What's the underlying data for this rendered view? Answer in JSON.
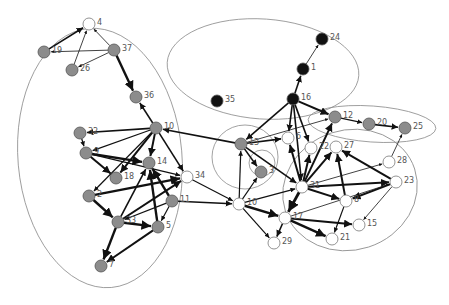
{
  "diagram": {
    "type": "directed-network-graph",
    "node_colors": {
      "gray": "#8c8c8c",
      "black": "#111111",
      "white": "#ffffff"
    },
    "edge_color": "#111111",
    "cluster_color": "#8a8a8a",
    "clusters": [
      {
        "id": "left",
        "cx": 100,
        "cy": 158,
        "rx": 82,
        "ry": 130,
        "rot": -5
      },
      {
        "id": "top-center",
        "cx": 263,
        "cy": 69,
        "rx": 96,
        "ry": 50,
        "rot": 4
      },
      {
        "id": "right-top",
        "cx": 372,
        "cy": 124,
        "rx": 64,
        "ry": 18,
        "rot": 4
      },
      {
        "id": "center-small",
        "cx": 245,
        "cy": 157,
        "rx": 33,
        "ry": 32,
        "rot": 0
      },
      {
        "id": "center-tiny",
        "cx": 262,
        "cy": 163,
        "rx": 13,
        "ry": 13,
        "rot": 0
      },
      {
        "id": "right-bottom",
        "cx": 350,
        "cy": 190,
        "rx": 68,
        "ry": 60,
        "rot": -18
      }
    ],
    "nodes": [
      {
        "id": "4",
        "label": "4",
        "x": 89,
        "y": 24,
        "color": "white"
      },
      {
        "id": "19",
        "label": "19",
        "x": 44,
        "y": 52,
        "color": "gray"
      },
      {
        "id": "37",
        "label": "37",
        "x": 114,
        "y": 50,
        "color": "gray"
      },
      {
        "id": "26",
        "label": "26",
        "x": 72,
        "y": 70,
        "color": "gray"
      },
      {
        "id": "36",
        "label": "36",
        "x": 136,
        "y": 97,
        "color": "gray"
      },
      {
        "id": "10a",
        "label": "10",
        "x": 156,
        "y": 128,
        "color": "gray"
      },
      {
        "id": "32",
        "label": "32",
        "x": 80,
        "y": 133,
        "color": "gray"
      },
      {
        "id": "9",
        "label": "9",
        "x": 86,
        "y": 153,
        "color": "gray"
      },
      {
        "id": "14",
        "label": "14",
        "x": 149,
        "y": 163,
        "color": "gray"
      },
      {
        "id": "18",
        "label": "18",
        "x": 116,
        "y": 178,
        "color": "gray"
      },
      {
        "id": "34",
        "label": "34",
        "x": 187,
        "y": 177,
        "color": "white"
      },
      {
        "id": "2",
        "label": "2",
        "x": 89,
        "y": 196,
        "color": "gray"
      },
      {
        "id": "11",
        "label": "11",
        "x": 172,
        "y": 201,
        "color": "gray"
      },
      {
        "id": "33",
        "label": "33",
        "x": 118,
        "y": 222,
        "color": "gray"
      },
      {
        "id": "5",
        "label": "5",
        "x": 158,
        "y": 227,
        "color": "gray"
      },
      {
        "id": "7",
        "label": "7",
        "x": 101,
        "y": 266,
        "color": "gray"
      },
      {
        "id": "24",
        "label": "24",
        "x": 322,
        "y": 39,
        "color": "black"
      },
      {
        "id": "1",
        "label": "1",
        "x": 303,
        "y": 69,
        "color": "black"
      },
      {
        "id": "35",
        "label": "35",
        "x": 217,
        "y": 101,
        "color": "black"
      },
      {
        "id": "16",
        "label": "16",
        "x": 293,
        "y": 99,
        "color": "black"
      },
      {
        "id": "12",
        "label": "12",
        "x": 335,
        "y": 117,
        "color": "gray"
      },
      {
        "id": "20",
        "label": "20",
        "x": 369,
        "y": 124,
        "color": "gray"
      },
      {
        "id": "25",
        "label": "25",
        "x": 405,
        "y": 128,
        "color": "gray"
      },
      {
        "id": "13",
        "label": "13",
        "x": 241,
        "y": 144,
        "color": "gray"
      },
      {
        "id": "6",
        "label": "6",
        "x": 288,
        "y": 138,
        "color": "white"
      },
      {
        "id": "22",
        "label": "22",
        "x": 311,
        "y": 148,
        "color": "white"
      },
      {
        "id": "27",
        "label": "27",
        "x": 336,
        "y": 147,
        "color": "white"
      },
      {
        "id": "28",
        "label": "28",
        "x": 389,
        "y": 162,
        "color": "white"
      },
      {
        "id": "3",
        "label": "3",
        "x": 261,
        "y": 172,
        "color": "gray"
      },
      {
        "id": "31",
        "label": "31",
        "x": 302,
        "y": 187,
        "color": "white"
      },
      {
        "id": "23",
        "label": "23",
        "x": 396,
        "y": 182,
        "color": "white"
      },
      {
        "id": "8",
        "label": "8",
        "x": 346,
        "y": 201,
        "color": "white"
      },
      {
        "id": "10b",
        "label": "10",
        "x": 239,
        "y": 204,
        "color": "white"
      },
      {
        "id": "17",
        "label": "17",
        "x": 285,
        "y": 218,
        "color": "white"
      },
      {
        "id": "15",
        "label": "15",
        "x": 359,
        "y": 225,
        "color": "white"
      },
      {
        "id": "21",
        "label": "21",
        "x": 332,
        "y": 239,
        "color": "white"
      },
      {
        "id": "29",
        "label": "29",
        "x": 274,
        "y": 243,
        "color": "white"
      }
    ],
    "edges": [
      {
        "from": "19",
        "to": "4",
        "w": 1.6
      },
      {
        "from": "37",
        "to": "4",
        "w": 0.8
      },
      {
        "from": "26",
        "to": "4",
        "w": 0.8
      },
      {
        "from": "37",
        "to": "19",
        "w": 0.8
      },
      {
        "from": "37",
        "to": "26",
        "w": 0.8
      },
      {
        "from": "37",
        "to": "36",
        "w": 2.4
      },
      {
        "from": "10a",
        "to": "36",
        "w": 1.6
      },
      {
        "from": "10a",
        "to": "32",
        "w": 1.6
      },
      {
        "from": "10a",
        "to": "9",
        "w": 1.2
      },
      {
        "from": "10a",
        "to": "14",
        "w": 2.0
      },
      {
        "from": "10a",
        "to": "18",
        "w": 2.0
      },
      {
        "from": "10a",
        "to": "34",
        "w": 1.6
      },
      {
        "from": "10a",
        "to": "2",
        "w": 1.2
      },
      {
        "from": "32",
        "to": "9",
        "w": 1.2
      },
      {
        "from": "9",
        "to": "18",
        "w": 2.0
      },
      {
        "from": "9",
        "to": "14",
        "w": 2.4
      },
      {
        "from": "9",
        "to": "34",
        "w": 1.2
      },
      {
        "from": "2",
        "to": "34",
        "w": 2.4
      },
      {
        "from": "2",
        "to": "33",
        "w": 2.4
      },
      {
        "from": "33",
        "to": "34",
        "w": 2.0
      },
      {
        "from": "33",
        "to": "14",
        "w": 1.6
      },
      {
        "from": "33",
        "to": "5",
        "w": 2.4
      },
      {
        "from": "33",
        "to": "7",
        "w": 2.4
      },
      {
        "from": "5",
        "to": "14",
        "w": 2.4
      },
      {
        "from": "5",
        "to": "7",
        "w": 2.0
      },
      {
        "from": "11",
        "to": "14",
        "w": 2.4
      },
      {
        "from": "11",
        "to": "33",
        "w": 1.2
      },
      {
        "from": "11",
        "to": "5",
        "w": 1.2
      },
      {
        "from": "34",
        "to": "10b",
        "w": 1.2
      },
      {
        "from": "11",
        "to": "10b",
        "w": 1.6
      },
      {
        "from": "13",
        "to": "10a",
        "w": 1.6
      },
      {
        "from": "10b",
        "to": "13",
        "w": 1.2
      },
      {
        "from": "10b",
        "to": "3",
        "w": 1.2
      },
      {
        "from": "13",
        "to": "3",
        "w": 1.6
      },
      {
        "from": "13",
        "to": "31",
        "w": 1.6
      },
      {
        "from": "16",
        "to": "13",
        "w": 1.6
      },
      {
        "from": "16",
        "to": "1",
        "w": 1.6
      },
      {
        "from": "1",
        "to": "24",
        "w": 0.8
      },
      {
        "from": "16",
        "to": "12",
        "w": 2.0
      },
      {
        "from": "16",
        "to": "6",
        "w": 1.6
      },
      {
        "from": "16",
        "to": "22",
        "w": 1.6
      },
      {
        "from": "16",
        "to": "31",
        "w": 1.6
      },
      {
        "from": "13",
        "to": "6",
        "w": 1.6
      },
      {
        "from": "13",
        "to": "12",
        "w": 0.8
      },
      {
        "from": "12",
        "to": "20",
        "w": 1.2
      },
      {
        "from": "20",
        "to": "25",
        "w": 1.6
      },
      {
        "from": "28",
        "to": "25",
        "w": 0.8
      },
      {
        "from": "31",
        "to": "6",
        "w": 2.0
      },
      {
        "from": "31",
        "to": "22",
        "w": 2.0
      },
      {
        "from": "31",
        "to": "27",
        "w": 2.0
      },
      {
        "from": "31",
        "to": "12",
        "w": 2.0
      },
      {
        "from": "31",
        "to": "23",
        "w": 2.0
      },
      {
        "from": "31",
        "to": "28",
        "w": 0.8
      },
      {
        "from": "31",
        "to": "8",
        "w": 2.0
      },
      {
        "from": "31",
        "to": "17",
        "w": 2.8
      },
      {
        "from": "8",
        "to": "27",
        "w": 2.0
      },
      {
        "from": "23",
        "to": "27",
        "w": 2.0
      },
      {
        "from": "23",
        "to": "8",
        "w": 2.0
      },
      {
        "from": "23",
        "to": "15",
        "w": 0.8
      },
      {
        "from": "8",
        "to": "21",
        "w": 1.2
      },
      {
        "from": "10b",
        "to": "31",
        "w": 1.2
      },
      {
        "from": "10b",
        "to": "17",
        "w": 2.4
      },
      {
        "from": "10b",
        "to": "29",
        "w": 1.2
      },
      {
        "from": "17",
        "to": "29",
        "w": 1.6
      },
      {
        "from": "17",
        "to": "21",
        "w": 2.4
      },
      {
        "from": "17",
        "to": "15",
        "w": 2.0
      },
      {
        "from": "17",
        "to": "23",
        "w": 0.8
      }
    ]
  }
}
